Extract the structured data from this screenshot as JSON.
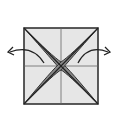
{
  "diagram": {
    "type": "origami-fold-step",
    "description": "Square paper with center crease lines and diagonal folds forming a gray X-shaped flap; arrows indicate pulling left and right flaps outward",
    "colors": {
      "paper": "#e6e6e6",
      "line": "#333333",
      "flap": "#8a8a8a",
      "crease": "#666666"
    },
    "arrows": [
      {
        "direction": "left",
        "label": ""
      },
      {
        "direction": "right",
        "label": ""
      }
    ]
  }
}
